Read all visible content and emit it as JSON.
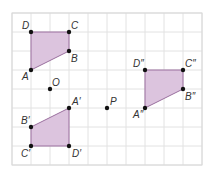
{
  "diagram": {
    "type": "coordinate-grid-transformations",
    "grid": {
      "origin_x": 12,
      "origin_y": 13,
      "cell": 19,
      "cols": 10,
      "rows": 8,
      "line_color": "#e2e2e2",
      "border_color": "#d8d8d8"
    },
    "colors": {
      "fill": "#dcc4de",
      "stroke": "#9a6f9e",
      "point": "#111111",
      "label": "#333333"
    },
    "shapes": [
      {
        "name": "ABCD",
        "vertices": [
          {
            "label": "A",
            "gx": 1,
            "gy": 3,
            "dx": -9,
            "dy": 10
          },
          {
            "label": "B",
            "gx": 3,
            "gy": 2,
            "dx": 2,
            "dy": 11
          },
          {
            "label": "C",
            "gx": 3,
            "gy": 1,
            "dx": 2,
            "dy": -3
          },
          {
            "label": "D",
            "gx": 1,
            "gy": 1,
            "dx": -9,
            "dy": -3
          }
        ]
      },
      {
        "name": "A'B'C'D'",
        "vertices": [
          {
            "label": "A′",
            "gx": 3,
            "gy": 5,
            "dx": 3,
            "dy": -3
          },
          {
            "label": "B′",
            "gx": 1,
            "gy": 6,
            "dx": -10,
            "dy": -3
          },
          {
            "label": "C′",
            "gx": 1,
            "gy": 7,
            "dx": -10,
            "dy": 11
          },
          {
            "label": "D′",
            "gx": 3,
            "gy": 7,
            "dx": 3,
            "dy": 11
          }
        ]
      },
      {
        "name": "A''B''C''D''",
        "vertices": [
          {
            "label": "A″",
            "gx": 7,
            "gy": 5,
            "dx": -12,
            "dy": 10
          },
          {
            "label": "B″",
            "gx": 9,
            "gy": 4,
            "dx": 2,
            "dy": 11
          },
          {
            "label": "C″",
            "gx": 9,
            "gy": 3,
            "dx": 2,
            "dy": -3
          },
          {
            "label": "D″",
            "gx": 7,
            "gy": 3,
            "dx": -12,
            "dy": -3
          }
        ]
      }
    ],
    "points": [
      {
        "label": "O",
        "gx": 2,
        "gy": 4,
        "dx": 2,
        "dy": -3
      },
      {
        "label": "P",
        "gx": 5,
        "gy": 5,
        "dx": 3,
        "dy": -3
      }
    ]
  }
}
